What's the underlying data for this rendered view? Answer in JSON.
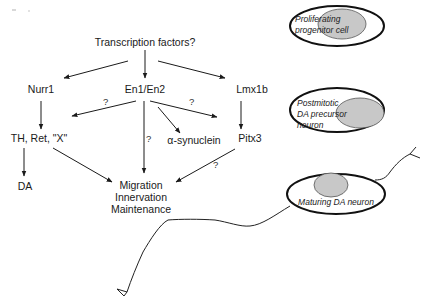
{
  "pathway": {
    "root": "Transcription factors?",
    "nodes": {
      "nurr1": "Nurr1",
      "en1_en2": "En1/En2",
      "lmx1b": "Lmx1b",
      "th_ret_x": "TH, Ret, \"X\"",
      "alpha_synuclein": "α-synuclein",
      "pitx3": "Pitx3",
      "da": "DA",
      "outcome_1": "Migration",
      "outcome_2": "Innervation",
      "outcome_3": "Maintenance"
    },
    "uncertain_marks": {
      "en_to_th": "?",
      "en_to_pitx3": "?",
      "en_to_outcome": "?",
      "pitx3_to_outcome": "?"
    }
  },
  "cell_stages": [
    {
      "label_lines": [
        "Proliferating",
        "progenitor cell"
      ]
    },
    {
      "label_lines": [
        "Postmitotic",
        "DA precursor",
        "neuron"
      ]
    },
    {
      "label_lines": [
        "Maturing DA neuron"
      ]
    }
  ],
  "colors": {
    "ink": "#1a1a1a",
    "nucleus_fill": "#c8c8c8",
    "background": "#ffffff"
  }
}
